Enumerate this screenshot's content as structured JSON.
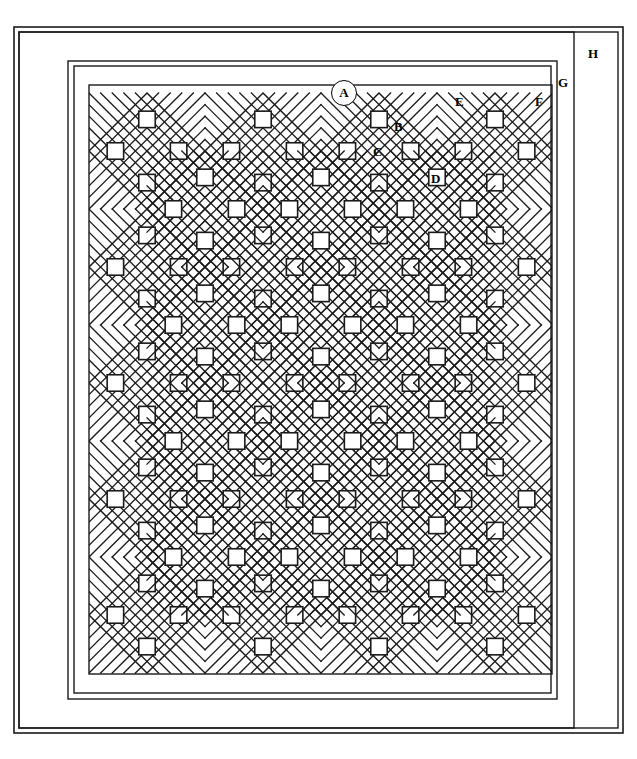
{
  "document": {
    "type": "quilt-pattern-diagram",
    "title_fragment": "",
    "background_color": "#ffffff",
    "line_color": "#1a1a1a"
  },
  "canvas": {
    "width": 637,
    "height": 759
  },
  "labels": [
    {
      "key": "A",
      "text": "A",
      "style": "circled",
      "x": 331,
      "y": 80,
      "note": "inner border strip"
    },
    {
      "key": "B",
      "text": "B",
      "style": "plain",
      "x": 394,
      "y": 120,
      "note": "small corner triangle"
    },
    {
      "key": "C",
      "text": "C",
      "style": "plain",
      "x": 373,
      "y": 145,
      "note": "small square patch"
    },
    {
      "key": "D",
      "text": "D",
      "style": "plain",
      "x": 431,
      "y": 172,
      "note": "setting triangle"
    },
    {
      "key": "E",
      "text": "E",
      "style": "plain",
      "x": 455,
      "y": 95,
      "note": "setting triangle upper"
    },
    {
      "key": "F",
      "text": "F",
      "style": "plain",
      "x": 535,
      "y": 95,
      "note": "outer field corner"
    },
    {
      "key": "G",
      "text": "G",
      "style": "plain",
      "x": 558,
      "y": 76,
      "note": "middle border"
    },
    {
      "key": "H",
      "text": "H",
      "style": "plain",
      "x": 588,
      "y": 47,
      "note": "outer border"
    }
  ],
  "frames": [
    {
      "name": "outer-edge",
      "x": 14,
      "y": 27,
      "w": 609,
      "h": 706,
      "stroke": 1.6
    },
    {
      "name": "outer-border-inner",
      "x": 19,
      "y": 32,
      "w": 599,
      "h": 696,
      "stroke": 1.4
    },
    {
      "name": "binding-h",
      "x": 19,
      "y": 32,
      "w": 555,
      "h": 696,
      "stroke": 1.4
    },
    {
      "name": "middle-border-g",
      "x": 68,
      "y": 61,
      "w": 489,
      "h": 638,
      "stroke": 1.4
    },
    {
      "name": "inner-border-a",
      "x": 74,
      "y": 66,
      "w": 477,
      "h": 627,
      "stroke": 1.4
    },
    {
      "name": "quilt-field",
      "x": 89,
      "y": 85,
      "w": 463,
      "h": 589,
      "stroke": 1.4
    }
  ],
  "grid": {
    "columns": 4,
    "rows": 5,
    "block_pitch_x": 116,
    "block_pitch_y": 116,
    "first_center_x": 147,
    "first_center_y": 151,
    "half_diagonal": 58,
    "inner_divisions": 5,
    "squares_per_block": 4,
    "square_positions": [
      "north",
      "east",
      "south",
      "west"
    ]
  },
  "legend_keys": {
    "A": "inner border strip",
    "B": "corner triangle",
    "C": "square patch",
    "D": "setting triangle",
    "E": "side setting triangle",
    "F": "field corner",
    "G": "middle border",
    "H": "outer border"
  }
}
